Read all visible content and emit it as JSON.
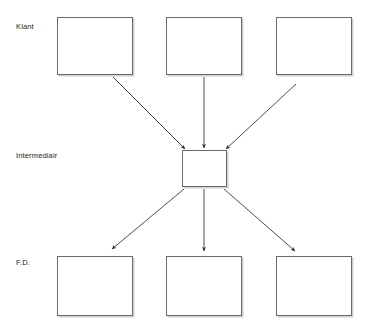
{
  "diagram": {
    "type": "flow-diagram",
    "orientation": "top-to-bottom",
    "background_color": "#ffffff",
    "box_border_color": "#6a6a6a",
    "arrow_color": "#3a3a3a",
    "text_color": "#231f20",
    "rows": [
      {
        "id": "klant",
        "label": "Klant",
        "label_x": 16,
        "label_y": 22,
        "nodes": [
          {
            "id": "klant-1",
            "label": "",
            "x": 57,
            "y": 17,
            "w": 76,
            "h": 58
          },
          {
            "id": "klant-2",
            "label": "",
            "x": 166,
            "y": 17,
            "w": 76,
            "h": 58
          },
          {
            "id": "klant-3",
            "label": "",
            "x": 276,
            "y": 17,
            "w": 76,
            "h": 58
          }
        ]
      },
      {
        "id": "intermediair",
        "label": "Intermediair",
        "label_x": 16,
        "label_y": 151,
        "nodes": [
          {
            "id": "intermediair-1",
            "label": "",
            "x": 182,
            "y": 150,
            "w": 45,
            "h": 37
          }
        ]
      },
      {
        "id": "fd",
        "label": "F.D.",
        "label_x": 16,
        "label_y": 258,
        "nodes": [
          {
            "id": "fd-1",
            "label": "",
            "x": 57,
            "y": 256,
            "w": 76,
            "h": 60
          },
          {
            "id": "fd-2",
            "label": "",
            "x": 166,
            "y": 256,
            "w": 76,
            "h": 60
          },
          {
            "id": "fd-3",
            "label": "",
            "x": 276,
            "y": 256,
            "w": 76,
            "h": 60
          }
        ]
      }
    ],
    "arrows": [
      {
        "id": "klant-1-to-intermediair",
        "from": "klant-1",
        "to": "intermediair-1",
        "x1": 113,
        "y1": 77,
        "x2": 185,
        "y2": 149
      },
      {
        "id": "klant-2-to-intermediair",
        "from": "klant-2",
        "to": "intermediair-1",
        "x1": 204,
        "y1": 77,
        "x2": 204,
        "y2": 148
      },
      {
        "id": "klant-3-to-intermediair",
        "from": "klant-3",
        "to": "intermediair-1",
        "x1": 296,
        "y1": 84,
        "x2": 226,
        "y2": 149
      },
      {
        "id": "intermediair-to-fd-1",
        "from": "intermediair-1",
        "to": "fd-1",
        "x1": 184,
        "y1": 189,
        "x2": 112,
        "y2": 249
      },
      {
        "id": "intermediair-to-fd-2",
        "from": "intermediair-1",
        "to": "fd-2",
        "x1": 204,
        "y1": 189,
        "x2": 204,
        "y2": 251
      },
      {
        "id": "intermediair-to-fd-3",
        "from": "intermediair-1",
        "to": "fd-3",
        "x1": 224,
        "y1": 189,
        "x2": 295,
        "y2": 251
      }
    ]
  }
}
